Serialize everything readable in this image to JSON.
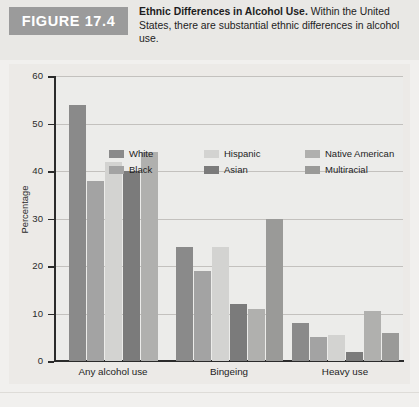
{
  "figure": {
    "badge": "FIGURE 17.4",
    "caption_bold": "Ethnic Differences in Alcohol Use.",
    "caption_rest": " Within the United States, there are substantial ethnic differences in alcohol use."
  },
  "colors": {
    "white_series": "#8a8a8a",
    "black_series": "#a3a3a3",
    "hispanic_series": "#d3d3d1",
    "asian_series": "#7b7b7b",
    "native_american_series": "#b0b0ae",
    "multiracial_series": "#9a9a98",
    "badge_bg": "#9b9b9b",
    "header_bg": "#e9e8e5",
    "plot_bg": "#eceae7",
    "axis": "#2b2b2b",
    "grid": "#c3c1be"
  },
  "chart_data": {
    "type": "bar",
    "title": "Ethnic Differences in Alcohol Use",
    "xlabel": "",
    "ylabel": "Percentage",
    "ylim": [
      0,
      60
    ],
    "yticks": [
      0,
      10,
      20,
      30,
      40,
      50,
      60
    ],
    "grid": true,
    "legend_position": "top-inside",
    "categories": [
      "Any alcohol use",
      "Bingeing",
      "Heavy use"
    ],
    "series": [
      {
        "name": "White",
        "values": [
          54,
          24,
          8
        ]
      },
      {
        "name": "Black",
        "values": [
          38,
          19,
          5
        ]
      },
      {
        "name": "Hispanic",
        "values": [
          42,
          24,
          5.5
        ]
      },
      {
        "name": "Asian",
        "values": [
          40,
          12,
          2
        ]
      },
      {
        "name": "Native American",
        "values": [
          44,
          11,
          10.5
        ]
      },
      {
        "name": "Multiracial",
        "values": [
          null,
          30,
          6
        ]
      }
    ]
  }
}
